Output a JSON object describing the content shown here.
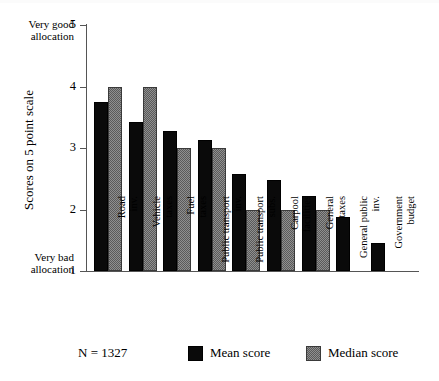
{
  "chart_data": {
    "type": "bar",
    "title": "",
    "xlabel": "",
    "ylabel": "Scores on 5 point scale",
    "ylim": [
      1,
      5
    ],
    "yticks": [
      1,
      2,
      3,
      4,
      5
    ],
    "grid": false,
    "legend_position": "bottom",
    "categories": [
      "Road inv.",
      "Vehicle taxes",
      "Fuel taxes",
      "Public transport inv.",
      "Public transport subs.",
      "Carpool facilities",
      "General taxes",
      "General public inv.",
      "Government budget"
    ],
    "category_lines": [
      [
        "Road",
        "inv."
      ],
      [
        "Vehicle",
        "taxes"
      ],
      [
        "Fuel",
        "taxes"
      ],
      [
        "Public transport",
        "inv."
      ],
      [
        "Public transport",
        "subs."
      ],
      [
        "Carpool",
        "facilities"
      ],
      [
        "General",
        "taxes"
      ],
      [
        "General public",
        "inv."
      ],
      [
        "Government",
        "budget"
      ]
    ],
    "series": [
      {
        "name": "Mean score",
        "color": "#0a0a0a",
        "values": [
          3.75,
          3.43,
          3.28,
          3.13,
          2.57,
          2.48,
          2.22,
          1.88,
          1.45
        ]
      },
      {
        "name": "Median score",
        "color": "#8f8f8f",
        "values": [
          4.0,
          4.0,
          3.0,
          3.0,
          2.0,
          2.0,
          2.0,
          null,
          null
        ]
      }
    ],
    "annotations": {
      "y_top_note": [
        "Very good",
        "allocation"
      ],
      "y_bottom_note": [
        "Very bad",
        "allocation"
      ],
      "sample_size": "N = 1327"
    }
  },
  "axis": {
    "tick_labels": [
      "5",
      "4",
      "3",
      "2",
      "1"
    ],
    "y_title": "Scores on 5 point scale",
    "very_good_line1": "Very good",
    "very_good_line2": "allocation",
    "very_bad_line1": "Very bad",
    "very_bad_line2": "allocation"
  },
  "legend": {
    "sample_size": "N = 1327",
    "mean_label": "Mean score",
    "median_label": "Median score"
  }
}
